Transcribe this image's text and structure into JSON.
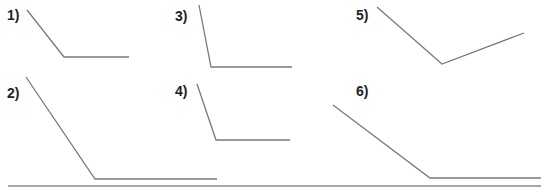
{
  "figure": {
    "line_color": "#7a7a7a",
    "rule_color": "#8a8a8a",
    "label_color": "#222222"
  },
  "angles": [
    {
      "label": "1)",
      "label_pos": [
        7,
        8
      ],
      "start": [
        27,
        10
      ],
      "vertex": [
        64,
        57
      ],
      "end": [
        129,
        57
      ]
    },
    {
      "label": "2)",
      "label_pos": [
        7,
        86
      ],
      "start": [
        26,
        77
      ],
      "vertex": [
        95,
        179
      ],
      "end": [
        217,
        179
      ]
    },
    {
      "label": "3)",
      "label_pos": [
        175,
        9
      ],
      "start": [
        199,
        5
      ],
      "vertex": [
        211,
        67
      ],
      "end": [
        292,
        67
      ]
    },
    {
      "label": "4)",
      "label_pos": [
        175,
        84
      ],
      "start": [
        197,
        84
      ],
      "vertex": [
        216,
        140
      ],
      "end": [
        290,
        140
      ]
    },
    {
      "label": "5)",
      "label_pos": [
        356,
        8
      ],
      "start": [
        377,
        7
      ],
      "vertex": [
        442,
        64
      ],
      "end": [
        524,
        33
      ]
    },
    {
      "label": "6)",
      "label_pos": [
        356,
        84
      ],
      "start": [
        333,
        105
      ],
      "vertex": [
        430,
        178
      ],
      "end": [
        541,
        178
      ]
    }
  ],
  "baseline_rule": {
    "x1": 8,
    "x2": 541,
    "y": 186
  }
}
